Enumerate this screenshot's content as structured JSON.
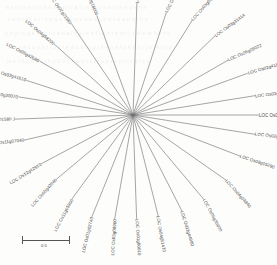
{
  "figure": {
    "type": "radial-phylogenetic-tree",
    "organism_prefix": "LOC Os",
    "center": {
      "x": 133,
      "y": 115
    },
    "scale_bar": {
      "label": "0.5",
      "length_px": 48,
      "position": {
        "x": 22,
        "y": 234
      }
    },
    "background_bleed": [
      "a s n i e  o n i  t h e  o e n t r a l  r e g i o n  o f  t h e  g e n e",
      "c e  o f  t h e  r i c e  g e n o m e  s e q u e n c e  a n d  t h e",
      "p h y l o g e n e t i c  a n a l y s i s  o f  t h e  f a m i l y  m e m b e r s",
      "w e r e  c o n s t r u c t e d  u s i n g  t h e  n e i g h b o r  j o i n i n g",
      "m e t h o d  w i t h  1 0 0 0  b o o t s t r a p  r e p l i c a t e s"
    ]
  },
  "leaves": [
    {
      "id": "l01",
      "label": "LOC Os01g04860",
      "angle": -88,
      "r": 112,
      "rot": -78
    },
    {
      "id": "l02",
      "label": "LOC Os02g03010",
      "angle": -72,
      "r": 108,
      "rot": -62
    },
    {
      "id": "l03",
      "label": "LOC Os03g05570",
      "angle": -58,
      "r": 112,
      "rot": -48
    },
    {
      "id": "l04",
      "label": "LOC Os03g31414",
      "angle": -44,
      "r": 114,
      "rot": -36
    },
    {
      "id": "l05",
      "label": "LOC Os06g09022",
      "angle": -30,
      "r": 110,
      "rot": -24
    },
    {
      "id": "l06",
      "label": "LOC Os02g41860",
      "angle": -20,
      "r": 122,
      "rot": -16
    },
    {
      "id": "l07",
      "label": "LOC Os03g17700",
      "angle": -9,
      "r": 124,
      "rot": -7
    },
    {
      "id": "l08",
      "label": "LOC Os03g27960",
      "angle": 0,
      "r": 126,
      "rot": 0
    },
    {
      "id": "l09",
      "label": "LOC Os02g08100",
      "angle": 9,
      "r": 124,
      "rot": 6
    },
    {
      "id": "l10",
      "label": "LOC Os08g05290",
      "angle": 21,
      "r": 115,
      "rot": 18
    },
    {
      "id": "l11",
      "label": "LOC Os04g34840",
      "angle": 35,
      "r": 114,
      "rot": 48
    },
    {
      "id": "l12",
      "label": "LOC Os05g35600",
      "angle": 50,
      "r": 110,
      "rot": 62
    },
    {
      "id": "l13",
      "label": "LOC Os02g44980",
      "angle": 63,
      "r": 108,
      "rot": 73
    },
    {
      "id": "l14",
      "label": "LOC Os04g51470",
      "angle": 76,
      "r": 104,
      "rot": 80
    },
    {
      "id": "l15",
      "label": "LOC Os01g60010",
      "angle": 88,
      "r": 104,
      "rot": 86
    },
    {
      "id": "l16",
      "label": "LOC Os03g08900",
      "angle": 100,
      "r": 106,
      "rot": 94
    },
    {
      "id": "l17",
      "label": "LOC Os01g02740",
      "angle": 112,
      "r": 110,
      "rot": 104
    },
    {
      "id": "l18",
      "label": "LOC Os11g05960",
      "angle": 126,
      "r": 104,
      "rot": 118
    },
    {
      "id": "l19",
      "label": "LOC Os05g42840",
      "angle": 140,
      "r": 100,
      "rot": 132
    },
    {
      "id": "l20",
      "label": "LOC Os12g42910",
      "angle": 152,
      "r": 104,
      "rot": 148
    },
    {
      "id": "l21",
      "label": "LOC Os11g07040",
      "angle": 167,
      "r": 112,
      "rot": 174
    },
    {
      "id": "l22",
      "label": "LOC Os11g01580 J",
      "angle": 178,
      "r": 118,
      "rot": 179
    },
    {
      "id": "l23",
      "label": "LOC Os10g30070",
      "angle": 189,
      "r": 116,
      "rot": 188
    },
    {
      "id": "l24",
      "label": "LOC Os02g41610",
      "angle": 198,
      "r": 112,
      "rot": 196
    },
    {
      "id": "l25",
      "label": "LOC Os05g42680",
      "angle": 210,
      "r": 108,
      "rot": 208
    },
    {
      "id": "l26",
      "label": "LOC Os04g58200",
      "angle": 222,
      "r": 106,
      "rot": 220
    },
    {
      "id": "l27",
      "label": "LOC Os02g21560",
      "angle": 236,
      "r": 110,
      "rot": 234
    },
    {
      "id": "l28",
      "label": "LOC Os02g16000",
      "angle": 250,
      "r": 106,
      "rot": 248
    }
  ]
}
